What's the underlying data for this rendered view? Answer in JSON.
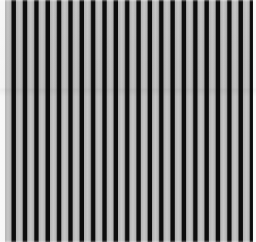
{
  "image": {
    "description": "Vertical black and gray striped texture pattern with thin white margins on left and right edges",
    "pattern": {
      "type": "vertical-stripes",
      "orientation_deg": 90,
      "dark_stripe_count": 22,
      "geometry": {
        "period_px": 11.35,
        "dark_width_px": 4.7,
        "light_width_px": 6.65,
        "left_margin_px": 5,
        "right_margin_px": 3,
        "edge_soften_px": 0.9
      },
      "colors": {
        "dark_stripe": "#0d0d0d",
        "light_stripe": "#b4b4b4",
        "light_stripe_highlight": "#c6c6c6",
        "background": "#f6f6f6"
      }
    }
  }
}
